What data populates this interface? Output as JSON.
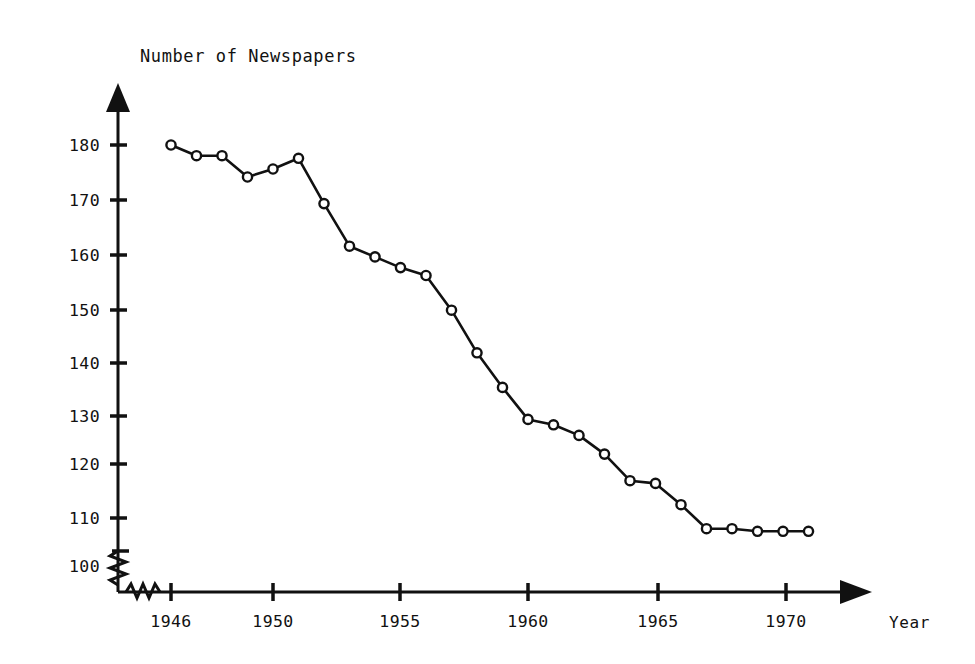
{
  "chart_data": {
    "type": "line",
    "title": "Number of Newspapers",
    "xlabel": "Year",
    "ylabel": "Number of Newspapers",
    "grid": false,
    "legend": null,
    "axis_break": true,
    "axis_arrows": [
      "y-top",
      "x-right"
    ],
    "marker": "open-circle",
    "xlim": [
      1945,
      1972
    ],
    "ylim": [
      96,
      186
    ],
    "x_tick_labels": [
      "1946",
      "1950",
      "1955",
      "1960",
      "1965",
      "1970"
    ],
    "x_tick_values": [
      1946,
      1950,
      1955,
      1960,
      1965,
      1970
    ],
    "y_tick_labels": [
      "100",
      "110",
      "120",
      "130",
      "140",
      "150",
      "160",
      "170",
      "180"
    ],
    "y_tick_values": [
      100,
      110,
      120,
      130,
      140,
      150,
      160,
      170,
      180
    ],
    "x": [
      1946,
      1947,
      1948,
      1949,
      1950,
      1951,
      1952,
      1953,
      1954,
      1955,
      1956,
      1957,
      1958,
      1959,
      1960,
      1961,
      1962,
      1963,
      1964,
      1965,
      1966,
      1967,
      1968,
      1969,
      1970,
      1971
    ],
    "values": [
      180,
      178,
      178,
      174,
      175.5,
      177.5,
      169,
      161,
      159,
      157,
      155.5,
      149,
      141,
      134.5,
      128.5,
      127.5,
      125.5,
      122,
      117,
      116.5,
      112.5,
      108,
      108,
      107.5,
      107.5,
      107.5
    ],
    "series": [
      {
        "name": "Number of Newspapers",
        "values": [
          180,
          178,
          178,
          174,
          175.5,
          177.5,
          169,
          161,
          159,
          157,
          155.5,
          149,
          141,
          134.5,
          128.5,
          127.5,
          125.5,
          122,
          117,
          116.5,
          112.5,
          108,
          108,
          107.5,
          107.5,
          107.5
        ]
      }
    ],
    "line_color": "#111111",
    "marker_face_color": "#ffffff",
    "marker_edge_color": "#111111"
  }
}
